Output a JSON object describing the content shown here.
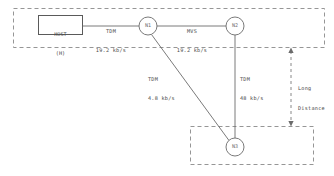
{
  "diagram": {
    "colors": {
      "line": "#6b6b6b",
      "dashed_boundary": "#8a8a8a",
      "text": "#4a4a4a",
      "node_text": "#6b6b6b",
      "background": "#ffffff"
    },
    "host": {
      "line1": "HOST",
      "line2": "(H)"
    },
    "nodes": [
      {
        "id": "n1",
        "label": "N1"
      },
      {
        "id": "n2",
        "label": "N2"
      },
      {
        "id": "n3",
        "label": "N3"
      }
    ],
    "links": [
      {
        "id": "host-n1",
        "protocol": "TDM",
        "rate": "19.2 kb/s"
      },
      {
        "id": "n1-n2",
        "protocol": "MVS",
        "rate": "19.2 kb/s"
      },
      {
        "id": "n1-n3",
        "protocol": "TDM",
        "rate": "4.8 kb/s"
      },
      {
        "id": "n2-n3",
        "protocol": "TDM",
        "rate": "48 kb/s"
      }
    ],
    "annotation": {
      "line1": "Long",
      "line2": "Distance"
    }
  }
}
